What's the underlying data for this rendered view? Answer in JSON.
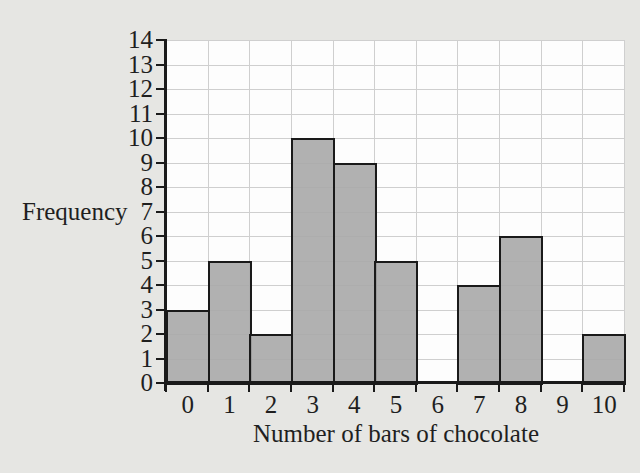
{
  "figure": {
    "kind": "frequency-bar-chart"
  },
  "chart_data": {
    "type": "bar",
    "title": "",
    "xlabel": "Number of bars of chocolate",
    "ylabel": "Frequency",
    "categories": [
      0,
      1,
      2,
      3,
      4,
      5,
      6,
      7,
      8,
      9,
      10
    ],
    "values": [
      3,
      5,
      2,
      10,
      9,
      5,
      0,
      4,
      6,
      0,
      2
    ],
    "ylim": [
      0,
      14
    ],
    "ytick_step": 1,
    "grid": true,
    "legend": "none",
    "colors": {
      "page_bg": "#e6e6e3",
      "plot_bg": "#fdfdfd",
      "grid": "#cfcfcf",
      "bar_fill": "rgba(169,169,169,0.9)",
      "ink": "#1a1a1a"
    }
  }
}
